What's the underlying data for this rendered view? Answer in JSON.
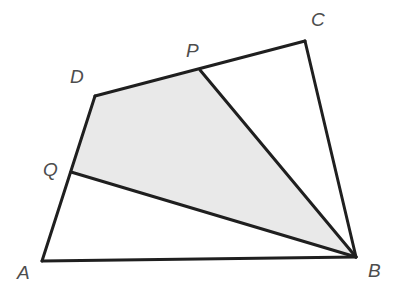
{
  "figure": {
    "canvas": {
      "width": 402,
      "height": 289,
      "background": "#ffffff"
    },
    "style": {
      "stroke_color": "#1f1f1f",
      "stroke_width": 3,
      "shaded_fill": "#e9e9e9",
      "unshaded_fill": "#ffffff",
      "label_color": "#4d4d4d",
      "label_font_size": 19
    },
    "points": {
      "A": {
        "name": "A",
        "label": "A",
        "x": 42,
        "y": 261,
        "label_x": 17,
        "label_y": 279
      },
      "B": {
        "name": "B",
        "label": "B",
        "x": 356,
        "y": 257,
        "label_x": 368,
        "label_y": 277
      },
      "C": {
        "name": "C",
        "label": "C",
        "x": 305,
        "y": 41,
        "label_x": 311,
        "label_y": 26
      },
      "D": {
        "name": "D",
        "label": "D",
        "x": 95,
        "y": 96,
        "label_x": 70,
        "label_y": 83
      },
      "P": {
        "name": "P",
        "label": "P",
        "x": 200,
        "y": 70,
        "label_x": 186,
        "label_y": 57
      },
      "Q": {
        "name": "Q",
        "label": "Q",
        "x": 71,
        "y": 172,
        "label_x": 43,
        "label_y": 176
      }
    },
    "polygons": {
      "outer_quadrilateral": {
        "name": "quadrilateral-ABCD",
        "vertices": [
          "A",
          "B",
          "C",
          "D"
        ],
        "points_path": "42,261 356,257 305,41 95,96",
        "fill": "#ffffff",
        "shaded": false
      },
      "shaded_region": {
        "name": "shaded-region-QDPB",
        "vertices": [
          "Q",
          "D",
          "P",
          "B"
        ],
        "points_path": "71,172 95,96 200,70 356,257",
        "fill": "#e9e9e9",
        "shaded": true
      }
    },
    "segments": [
      {
        "name": "segment-AB",
        "from": "A",
        "to": "B",
        "x1": 42,
        "y1": 261,
        "x2": 356,
        "y2": 257
      },
      {
        "name": "segment-BC",
        "from": "B",
        "to": "C",
        "x1": 356,
        "y1": 257,
        "x2": 305,
        "y2": 41
      },
      {
        "name": "segment-CD",
        "from": "C",
        "to": "D",
        "x1": 305,
        "y1": 41,
        "x2": 95,
        "y2": 96
      },
      {
        "name": "segment-DA",
        "from": "D",
        "to": "A",
        "x1": 95,
        "y1": 96,
        "x2": 42,
        "y2": 261
      },
      {
        "name": "segment-PB",
        "from": "P",
        "to": "B",
        "x1": 200,
        "y1": 70,
        "x2": 356,
        "y2": 257
      },
      {
        "name": "segment-QB",
        "from": "Q",
        "to": "B",
        "x1": 71,
        "y1": 172,
        "x2": 356,
        "y2": 257
      }
    ],
    "labels": [
      {
        "name": "label-A",
        "text": "A",
        "x": 17,
        "y": 279
      },
      {
        "name": "label-B",
        "text": "B",
        "x": 368,
        "y": 277
      },
      {
        "name": "label-C",
        "text": "C",
        "x": 311,
        "y": 26
      },
      {
        "name": "label-D",
        "text": "D",
        "x": 70,
        "y": 83
      },
      {
        "name": "label-P",
        "text": "P",
        "x": 186,
        "y": 57
      },
      {
        "name": "label-Q",
        "text": "Q",
        "x": 43,
        "y": 176
      }
    ]
  }
}
